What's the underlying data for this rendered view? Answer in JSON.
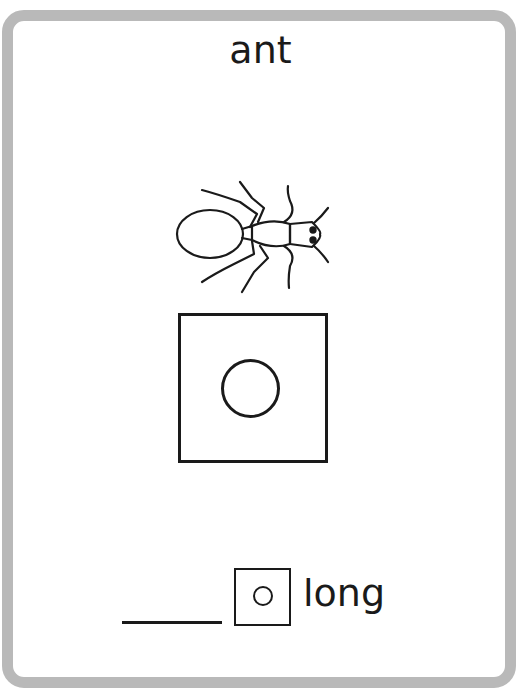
{
  "card": {
    "title": "ant",
    "picture": "ant-illustration",
    "vowel_box": {
      "symbol": "circle",
      "meaning": "long vowel symbol"
    },
    "answer_line": {
      "value": ""
    },
    "small_vowel_box": {
      "symbol": "circle"
    },
    "label": "long"
  },
  "colors": {
    "border": "#b9b9b9",
    "ink": "#1a1a1a",
    "background": "#ffffff"
  }
}
